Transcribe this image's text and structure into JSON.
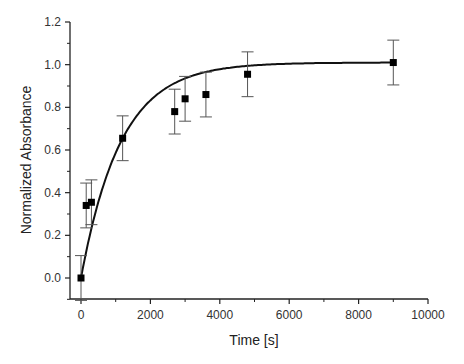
{
  "chart_data": {
    "type": "scatter",
    "title": "",
    "xlabel": "Time [s]",
    "ylabel": "Normalized Absorbance",
    "xlim": [
      0,
      10000
    ],
    "ylim": [
      -0.1,
      1.2
    ],
    "xticks": [
      0,
      2000,
      4000,
      6000,
      8000,
      10000
    ],
    "xtick_labels": [
      "0",
      "2000",
      "4000",
      "6000",
      "8000",
      "10000"
    ],
    "yticks": [
      0.0,
      0.2,
      0.4,
      0.6,
      0.8,
      1.0,
      1.2
    ],
    "ytick_labels": [
      "0.0",
      "0.2",
      "0.4",
      "0.6",
      "0.8",
      "1.0",
      "1.2"
    ],
    "grid": false,
    "legend": null,
    "series": [
      {
        "name": "data",
        "marker": "square",
        "x": [
          0,
          150,
          300,
          1200,
          2700,
          3000,
          3600,
          4800,
          9000
        ],
        "y": [
          0.0,
          0.34,
          0.355,
          0.655,
          0.78,
          0.84,
          0.86,
          0.955,
          1.01
        ],
        "yerr": [
          0.105,
          0.105,
          0.105,
          0.105,
          0.105,
          0.105,
          0.105,
          0.105,
          0.105
        ]
      },
      {
        "name": "fit",
        "type": "line",
        "function": "y = 1.01 * (1 - exp(-t / 1150))",
        "x": [
          0,
          500,
          1000,
          1500,
          2000,
          3000,
          4000,
          5000,
          6000,
          7000,
          8000,
          9000
        ],
        "y": [
          0.0,
          0.357,
          0.588,
          0.737,
          0.834,
          0.935,
          0.976,
          0.997,
          1.004,
          1.007,
          1.009,
          1.01
        ]
      }
    ]
  }
}
